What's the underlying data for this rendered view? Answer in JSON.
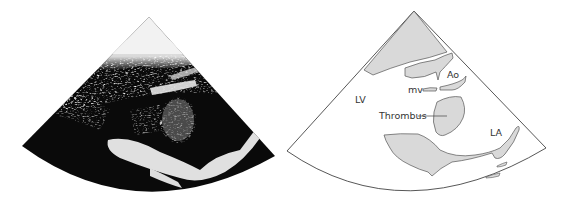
{
  "figure": {
    "left_panel": {
      "type": "echocardiogram",
      "description": "Parasternal long-axis ultrasound image (black sector with bright echoes)"
    },
    "right_panel": {
      "type": "schematic",
      "labels": {
        "lv": "LV",
        "ao": "Ao",
        "mv": "mv",
        "thrombus": "Thrombus",
        "la": "LA"
      }
    },
    "colors": {
      "sector_bg": "#0a0a0a",
      "structure_fill": "#d9d9d9",
      "outline": "#444444",
      "background": "#ffffff"
    }
  }
}
